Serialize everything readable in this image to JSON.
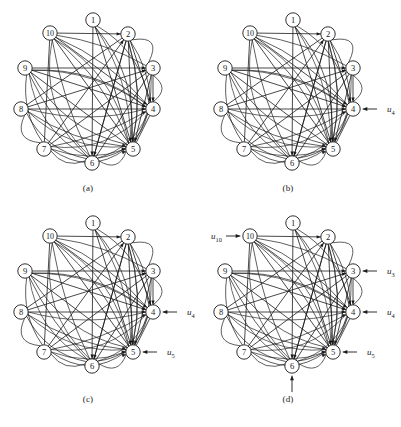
{
  "figure": {
    "title": "",
    "background_color": "#ffffff",
    "ink_color": "#1a1a1a",
    "node_labels": [
      "1",
      "2",
      "3",
      "4",
      "5",
      "6",
      "7",
      "8",
      "9",
      "10"
    ],
    "panels": [
      {
        "id": "a",
        "caption": "(a)",
        "inputs": []
      },
      {
        "id": "b",
        "caption": "(b)",
        "inputs": [
          {
            "label": "u",
            "sub": "4",
            "node": "4",
            "direction": "left"
          }
        ]
      },
      {
        "id": "c",
        "caption": "(c)",
        "inputs": [
          {
            "label": "u",
            "sub": "4",
            "node": "4",
            "direction": "left"
          },
          {
            "label": "u",
            "sub": "5",
            "node": "5",
            "direction": "left"
          }
        ]
      },
      {
        "id": "d",
        "caption": "(d)",
        "inputs": [
          {
            "label": "u",
            "sub": "10",
            "node": "10",
            "direction": "right"
          },
          {
            "label": "u",
            "sub": "3",
            "node": "3",
            "direction": "left"
          },
          {
            "label": "u",
            "sub": "4",
            "node": "4",
            "direction": "left"
          },
          {
            "label": "u",
            "sub": "5",
            "node": "5",
            "direction": "left"
          },
          {
            "label": "u",
            "sub": "6",
            "node": "6",
            "direction": "up"
          }
        ]
      }
    ],
    "node_positions": [
      {
        "id": "1",
        "x": 93,
        "y": 18
      },
      {
        "id": "2",
        "x": 128,
        "y": 32
      },
      {
        "id": "3",
        "x": 153,
        "y": 66
      },
      {
        "id": "4",
        "x": 153,
        "y": 107
      },
      {
        "id": "5",
        "x": 133,
        "y": 147
      },
      {
        "id": "6",
        "x": 92,
        "y": 161
      },
      {
        "id": "7",
        "x": 44,
        "y": 147
      },
      {
        "id": "8",
        "x": 21,
        "y": 107
      },
      {
        "id": "9",
        "x": 25,
        "y": 66
      },
      {
        "id": "10",
        "x": 50,
        "y": 31
      }
    ],
    "straight_edges": [
      [
        "10",
        "2"
      ],
      [
        "10",
        "7"
      ],
      [
        "2",
        "5"
      ],
      [
        "2",
        "4"
      ],
      [
        "1",
        "5"
      ],
      [
        "1",
        "6"
      ],
      [
        "9",
        "4"
      ],
      [
        "9",
        "3"
      ],
      [
        "8",
        "4"
      ],
      [
        "8",
        "3"
      ],
      [
        "7",
        "2"
      ],
      [
        "7",
        "3"
      ],
      [
        "6",
        "2"
      ],
      [
        "6",
        "3"
      ],
      [
        "10",
        "5"
      ],
      [
        "9",
        "5"
      ],
      [
        "2",
        "6"
      ],
      [
        "3",
        "5"
      ],
      [
        "3",
        "4"
      ],
      [
        "5",
        "4"
      ],
      [
        "10",
        "4"
      ],
      [
        "8",
        "2"
      ]
    ],
    "curved_edges": [
      [
        "10",
        "3"
      ],
      [
        "10",
        "4"
      ],
      [
        "10",
        "5"
      ],
      [
        "9",
        "4"
      ],
      [
        "9",
        "5"
      ],
      [
        "9",
        "6"
      ],
      [
        "8",
        "5"
      ],
      [
        "8",
        "6"
      ],
      [
        "8",
        "7"
      ],
      [
        "7",
        "5"
      ],
      [
        "7",
        "4"
      ],
      [
        "7",
        "6"
      ],
      [
        "6",
        "5"
      ],
      [
        "6",
        "4"
      ],
      [
        "2",
        "3"
      ],
      [
        "2",
        "4"
      ],
      [
        "2",
        "5"
      ],
      [
        "3",
        "4"
      ],
      [
        "1",
        "4"
      ],
      [
        "1",
        "5"
      ],
      [
        "10",
        "6"
      ],
      [
        "9",
        "7"
      ]
    ]
  }
}
